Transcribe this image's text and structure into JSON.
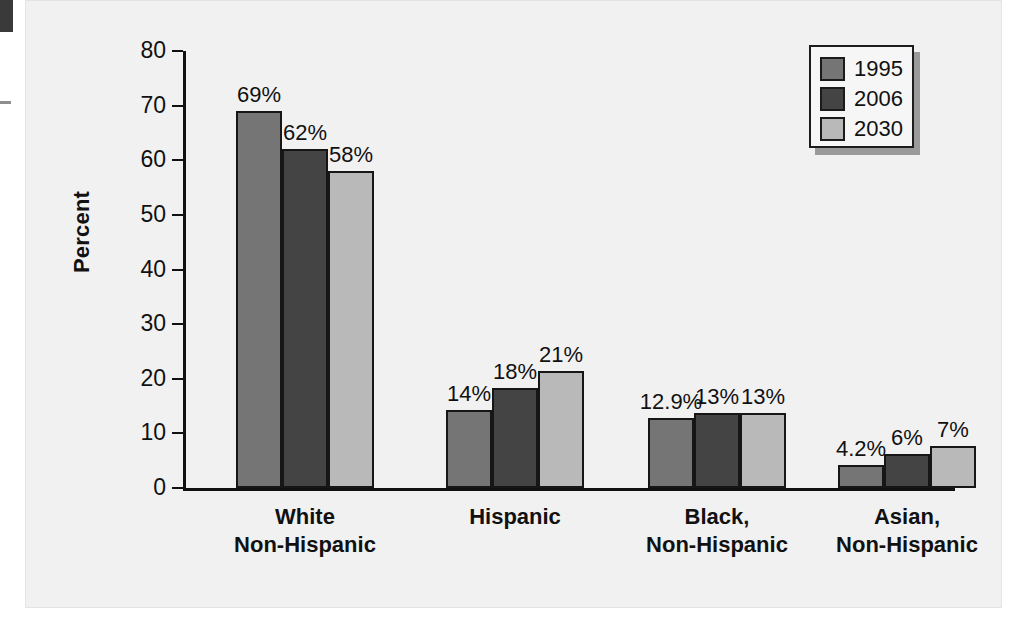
{
  "chart_data": {
    "type": "bar",
    "title": "",
    "xlabel": "",
    "ylabel": "Percent",
    "ylim": [
      0,
      80
    ],
    "yticks": [
      0,
      10,
      20,
      30,
      40,
      50,
      60,
      70,
      80
    ],
    "grid": false,
    "legend_position": "top-right",
    "categories": [
      "White\nNon-Hispanic",
      "Hispanic",
      "Black,\nNon-Hispanic",
      "Asian,\nNon-Hispanic"
    ],
    "series": [
      {
        "name": "1995",
        "color": "#757575",
        "values": [
          69,
          14.3,
          12.9,
          4.2
        ],
        "labels": [
          "69%",
          "14%",
          "12.9%",
          "4.2%"
        ]
      },
      {
        "name": "2006",
        "color": "#444444",
        "values": [
          62,
          18.3,
          13.7,
          6.3
        ],
        "labels": [
          "62%",
          "18%",
          "13%",
          "6%"
        ]
      },
      {
        "name": "2030",
        "color": "#b9b9b9",
        "values": [
          58,
          21.4,
          13.7,
          7.6
        ],
        "labels": [
          "58%",
          "21%",
          "13%",
          "7%"
        ]
      }
    ]
  },
  "legend": {
    "items": [
      {
        "label": "1995",
        "color": "#757575"
      },
      {
        "label": "2006",
        "color": "#444444"
      },
      {
        "label": "2030",
        "color": "#b9b9b9"
      }
    ]
  },
  "axis": {
    "y_title": "Percent",
    "y_tick_labels": [
      "80",
      "70",
      "60",
      "50",
      "40",
      "30",
      "20",
      "10",
      "0"
    ]
  },
  "colors": {
    "panel_background": "#f1f1f1",
    "axis": "#111111",
    "bar_outline": "#161616",
    "legend_shadow": "#9a9a9a"
  }
}
